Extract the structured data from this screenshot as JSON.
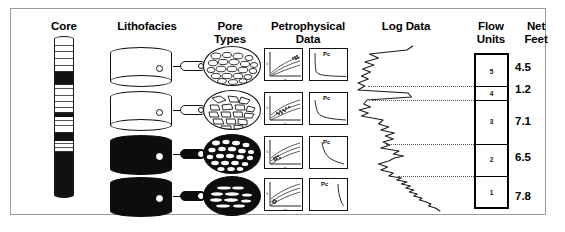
{
  "diagram": {
    "columns": [
      {
        "key": "core",
        "label": "Core"
      },
      {
        "key": "lithofacies",
        "label": "Lithofacies"
      },
      {
        "key": "pore_types",
        "label": "Pore\nTypes"
      },
      {
        "key": "petrophysical",
        "label": "Petrophysical\nData"
      },
      {
        "key": "log_data",
        "label": "Log Data"
      },
      {
        "key": "flow_units",
        "label": "Flow\nUnits"
      },
      {
        "key": "net_feet",
        "label": "Net\nFeet"
      }
    ]
  },
  "core_column": {
    "name": "core-slab",
    "bands": [
      {
        "top": 0,
        "height": 32,
        "fill": "light"
      },
      {
        "top": 32,
        "height": 13,
        "fill": "dark"
      },
      {
        "top": 45,
        "height": 28,
        "fill": "light"
      },
      {
        "top": 73,
        "height": 5,
        "fill": "dark"
      },
      {
        "top": 78,
        "height": 15,
        "fill": "light"
      },
      {
        "top": 93,
        "height": 9,
        "fill": "dark"
      },
      {
        "top": 102,
        "height": 10,
        "fill": "light"
      },
      {
        "top": 112,
        "height": 44,
        "fill": "dark"
      }
    ],
    "laminations": [
      6,
      12,
      19,
      26,
      49,
      56,
      62,
      68,
      81,
      86,
      104,
      108
    ]
  },
  "lithofacies": {
    "rows": [
      {
        "id": 1,
        "name": "grainstone-cylinder",
        "style": "light",
        "plug": "light",
        "top": 47
      },
      {
        "id": 2,
        "name": "packstone-cylinder",
        "style": "striped",
        "plug": "light",
        "top": 91
      },
      {
        "id": 3,
        "name": "wackestone-cylinder",
        "style": "dark",
        "plug": "dark",
        "top": 135
      },
      {
        "id": 4,
        "name": "mudstone-cylinder",
        "style": "dark",
        "plug": "dark",
        "top": 177
      }
    ]
  },
  "pore_types": {
    "rows": [
      {
        "id": 1,
        "name": "interparticle-pore-ellipse",
        "style": "light",
        "top": 46
      },
      {
        "id": 2,
        "name": "intercrystalline-pore-ellipse",
        "style": "light",
        "top": 90
      },
      {
        "id": 3,
        "name": "moldic-pore-ellipse",
        "style": "dark",
        "top": 134
      },
      {
        "id": 4,
        "name": "vuggy-pore-ellipse",
        "style": "dark",
        "top": 176
      }
    ]
  },
  "petrophysical": {
    "pc_label": "Pc",
    "rows": [
      {
        "id": 1,
        "top": 48
      },
      {
        "id": 2,
        "top": 92
      },
      {
        "id": 3,
        "top": 136
      },
      {
        "id": 4,
        "top": 178
      }
    ]
  },
  "flow_units": {
    "units": [
      {
        "label": "5",
        "net_feet": "4.5",
        "top": 53,
        "height": 33
      },
      {
        "label": "4",
        "net_feet": "1.2",
        "top": 86,
        "height": 14
      },
      {
        "label": "3",
        "net_feet": "7.1",
        "top": 100,
        "height": 44
      },
      {
        "label": "2",
        "net_feet": "6.5",
        "top": 144,
        "height": 32
      },
      {
        "label": "1",
        "net_feet": "7.8",
        "top": 176,
        "height": 33
      }
    ]
  },
  "chart_data": {
    "type": "line",
    "title": "Log Data",
    "xlabel": "",
    "ylabel": "Depth",
    "grid": false,
    "legend": "none",
    "series": [
      {
        "name": "wireline-log-curve",
        "note": "Deflection trace; x = relative log response, y = depth (px from top of track)",
        "x": [
          100,
          95,
          62,
          70,
          58,
          66,
          56,
          63,
          55,
          61,
          52,
          58,
          52,
          96,
          99,
          60,
          57,
          63,
          53,
          61,
          55,
          74,
          70,
          79,
          72,
          84,
          76,
          83,
          74,
          80,
          72,
          88,
          83,
          92,
          84,
          79,
          70,
          78,
          72,
          83,
          79,
          90,
          86,
          95,
          90,
          98,
          94,
          101,
          97,
          104,
          101,
          108,
          106,
          112,
          116,
          114,
          120,
          124
        ],
        "y": [
          2,
          6,
          10,
          14,
          18,
          21,
          25,
          28,
          32,
          35,
          39,
          42,
          46,
          49,
          53,
          56,
          60,
          63,
          66,
          69,
          72,
          76,
          80,
          83,
          86,
          89,
          92,
          95,
          98,
          101,
          104,
          107,
          110,
          112,
          114,
          117,
          120,
          123,
          126,
          129,
          132,
          134,
          136,
          138,
          140,
          142,
          144,
          146,
          148,
          150,
          152,
          154,
          156,
          158,
          160,
          162,
          164,
          167
        ]
      }
    ],
    "boundaries": [
      {
        "name": "fu-boundary-5-4",
        "y": 33
      },
      {
        "name": "fu-boundary-4-3",
        "y": 47
      },
      {
        "name": "fu-boundary-3-2",
        "y": 91
      },
      {
        "name": "fu-boundary-2-1",
        "y": 123
      }
    ]
  }
}
